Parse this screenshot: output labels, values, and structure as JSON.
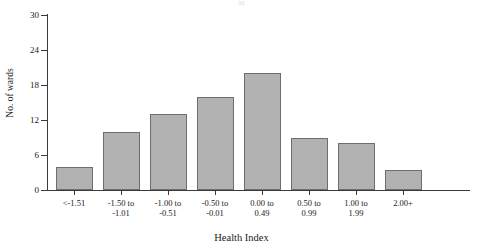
{
  "caption_remnant": "30",
  "chart_data": {
    "type": "bar",
    "title": "",
    "xlabel": "Health Index",
    "ylabel": "No. of wards",
    "categories": [
      "<-1.51",
      "-1.50 to\n-1.01",
      "-1.00 to\n-0.51",
      "-0.50 to\n-0.01",
      "0.00 to\n0.49",
      "0.50 to\n0.99",
      "1.00 to\n1.99",
      "2.00+"
    ],
    "values": [
      4,
      10,
      13,
      16,
      20,
      9,
      8,
      3.5
    ],
    "ylim": [
      0,
      30
    ],
    "yticks": [
      0,
      6,
      12,
      18,
      24,
      30
    ],
    "ytick_labels": [
      "0",
      "6",
      "12",
      "18",
      "24",
      "30"
    ],
    "grid": false,
    "legend": false,
    "bar_color": "#b2b2b2",
    "bar_edge_color": "#6e6e6e",
    "axis_color": "#3a3a3a"
  }
}
